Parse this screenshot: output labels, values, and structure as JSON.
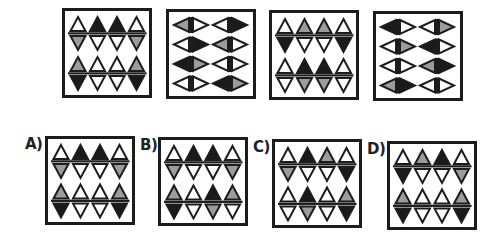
{
  "colors": {
    "W": "#ffffff",
    "K": "#1a1a1a",
    "G": "#9c9c9c",
    "stroke": "#1c1c1c"
  },
  "sequence": {
    "panels": [
      {
        "id": "seq-1",
        "orientation": "vertical",
        "box": [
          62,
          8,
          90,
          90
        ],
        "rows": [
          {
            "top": [
              "W",
              "K",
              "K",
              "W"
            ],
            "bottom": [
              "G",
              "W",
              "W",
              "G"
            ]
          },
          {
            "top": [
              "G",
              "W",
              "W",
              "G"
            ],
            "bottom": [
              "K",
              "W",
              "W",
              "K"
            ]
          }
        ]
      },
      {
        "id": "seq-2",
        "orientation": "horizontal",
        "box": [
          166,
          9,
          90,
          90
        ],
        "rows": [
          [
            [
              "G",
              "W"
            ],
            [
              "W",
              "K"
            ]
          ],
          [
            [
              "W",
              "K"
            ],
            [
              "G",
              "W"
            ]
          ],
          [
            [
              "K",
              "G"
            ],
            [
              "W",
              "W"
            ]
          ],
          [
            [
              "W",
              "W"
            ],
            [
              "K",
              "G"
            ]
          ]
        ]
      },
      {
        "id": "seq-3",
        "orientation": "vertical",
        "box": [
          269,
          10,
          90,
          90
        ],
        "rows": [
          {
            "top": [
              "W",
              "G",
              "G",
              "W"
            ],
            "bottom": [
              "K",
              "W",
              "W",
              "K"
            ]
          },
          {
            "top": [
              "W",
              "K",
              "K",
              "W"
            ],
            "bottom": [
              "W",
              "G",
              "G",
              "W"
            ]
          }
        ]
      },
      {
        "id": "seq-4",
        "orientation": "horizontal",
        "box": [
          373,
          11,
          90,
          90
        ],
        "rows": [
          [
            [
              "K",
              "W"
            ],
            [
              "W",
              "G"
            ]
          ],
          [
            [
              "W",
              "G"
            ],
            [
              "K",
              "W"
            ]
          ],
          [
            [
              "W",
              "W"
            ],
            [
              "G",
              "K"
            ]
          ],
          [
            [
              "G",
              "K"
            ],
            [
              "W",
              "W"
            ]
          ]
        ]
      }
    ]
  },
  "options": [
    {
      "label": "A)",
      "label_pos": [
        25,
        135
      ],
      "orientation": "vertical",
      "box": [
        45,
        136,
        90,
        89
      ],
      "rows": [
        {
          "top": [
            "W",
            "K",
            "K",
            "W"
          ],
          "bottom": [
            "G",
            "W",
            "W",
            "G"
          ]
        },
        {
          "top": [
            "G",
            "W",
            "W",
            "G"
          ],
          "bottom": [
            "K",
            "W",
            "W",
            "K"
          ]
        }
      ]
    },
    {
      "label": "B)",
      "label_pos": [
        140,
        136
      ],
      "orientation": "vertical",
      "box": [
        158,
        137,
        90,
        89
      ],
      "rows": [
        {
          "top": [
            "W",
            "K",
            "K",
            "W"
          ],
          "bottom": [
            "G",
            "W",
            "W",
            "G"
          ]
        },
        {
          "top": [
            "G",
            "W",
            "K",
            "G"
          ],
          "bottom": [
            "K",
            "W",
            "G",
            "W"
          ]
        }
      ]
    },
    {
      "label": "C)",
      "label_pos": [
        253,
        138
      ],
      "orientation": "vertical",
      "box": [
        272,
        139,
        90,
        89
      ],
      "rows": [
        {
          "top": [
            "W",
            "K",
            "G",
            "W"
          ],
          "bottom": [
            "G",
            "W",
            "W",
            "K"
          ]
        },
        {
          "top": [
            "W",
            "K",
            "W",
            "G"
          ],
          "bottom": [
            "W",
            "G",
            "W",
            "K"
          ]
        }
      ]
    },
    {
      "label": "D)",
      "label_pos": [
        367,
        140
      ],
      "orientation": "vertical",
      "box": [
        387,
        141,
        90,
        89
      ],
      "rows": [
        {
          "top": [
            "W",
            "G",
            "K",
            "W"
          ],
          "bottom": [
            "K",
            "W",
            "W",
            "G"
          ]
        },
        {
          "top": [
            "G",
            "W",
            "W",
            "G"
          ],
          "bottom": [
            "K",
            "W",
            "W",
            "K"
          ]
        }
      ]
    }
  ]
}
